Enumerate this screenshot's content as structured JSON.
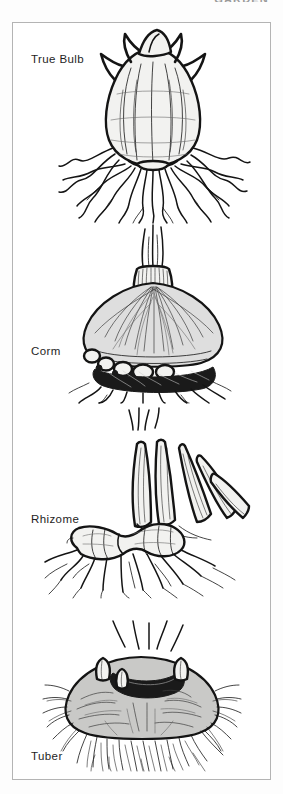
{
  "page": {
    "running_header": "GARDEN",
    "background_color": "#fdfdfd",
    "frame_color": "#b4b4b4"
  },
  "diagram": {
    "type": "botanical-illustration",
    "panel_count": 4,
    "panels": [
      {
        "id": "true-bulb",
        "label": "True Bulb",
        "label_x": 30,
        "label_y": 58,
        "description": "Layered onion-like bulb with papery tunic and fibrous roots",
        "features": [
          "concentric scale layers",
          "papery tunic",
          "basal plate",
          "fibrous roots",
          "dried neck"
        ]
      },
      {
        "id": "corm",
        "label": "Corm",
        "label_x": 30,
        "label_y": 351,
        "description": "Solid swollen stem base with cormels and old root band",
        "features": [
          "solid stem tissue",
          "dried leaf bases",
          "cormels",
          "basal root band"
        ]
      },
      {
        "id": "rhizome",
        "label": "Rhizome",
        "label_x": 30,
        "label_y": 518,
        "description": "Horizontal thickened stem with fan of sword-shaped leaves",
        "features": [
          "horizontal stem",
          "segmented joints",
          "fan of leaves",
          "lateral roots"
        ]
      },
      {
        "id": "tuber",
        "label": "Tuber",
        "label_x": 30,
        "label_y": 755,
        "description": "Flattened swollen underground stem with eyes and dense root mat",
        "features": [
          "flattened body",
          "eyes / growth buds",
          "dense fibrous root mat"
        ]
      }
    ]
  }
}
